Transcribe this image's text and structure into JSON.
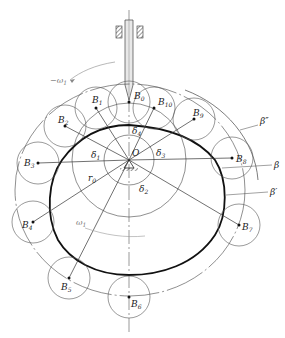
{
  "diagram": {
    "center_label": "O",
    "base_radius_label": "r0",
    "rotation_label": "ω1",
    "curve_labels": {
      "actual_profile": "β",
      "pitch_curve": "β′",
      "offset_curve": "β″"
    },
    "angle_labels": [
      "δ1",
      "δ2",
      "δ3",
      "δ4"
    ],
    "roller_positions": [
      {
        "label": "B0",
        "main": "B",
        "sub": "0",
        "x": 129,
        "y": 102
      },
      {
        "label": "B1",
        "main": "B",
        "sub": "1",
        "x": 96,
        "y": 108
      },
      {
        "label": "B2",
        "main": "B",
        "sub": "2",
        "x": 65,
        "y": 126
      },
      {
        "label": "B3",
        "main": "B",
        "sub": "3",
        "x": 38,
        "y": 163
      },
      {
        "label": "B4",
        "main": "B",
        "sub": "4",
        "x": 33,
        "y": 222
      },
      {
        "label": "B5",
        "main": "B",
        "sub": "5",
        "x": 69,
        "y": 278
      },
      {
        "label": "B6",
        "main": "B",
        "sub": "6",
        "x": 129,
        "y": 297
      },
      {
        "label": "B7",
        "main": "B",
        "sub": "7",
        "x": 239,
        "y": 225
      },
      {
        "label": "B8",
        "main": "B",
        "sub": "8",
        "x": 232,
        "y": 158
      },
      {
        "label": "B9",
        "main": "B",
        "sub": "9",
        "x": 194,
        "y": 119
      },
      {
        "label": "B10",
        "main": "B",
        "sub": "10",
        "x": 154,
        "y": 108
      }
    ]
  }
}
